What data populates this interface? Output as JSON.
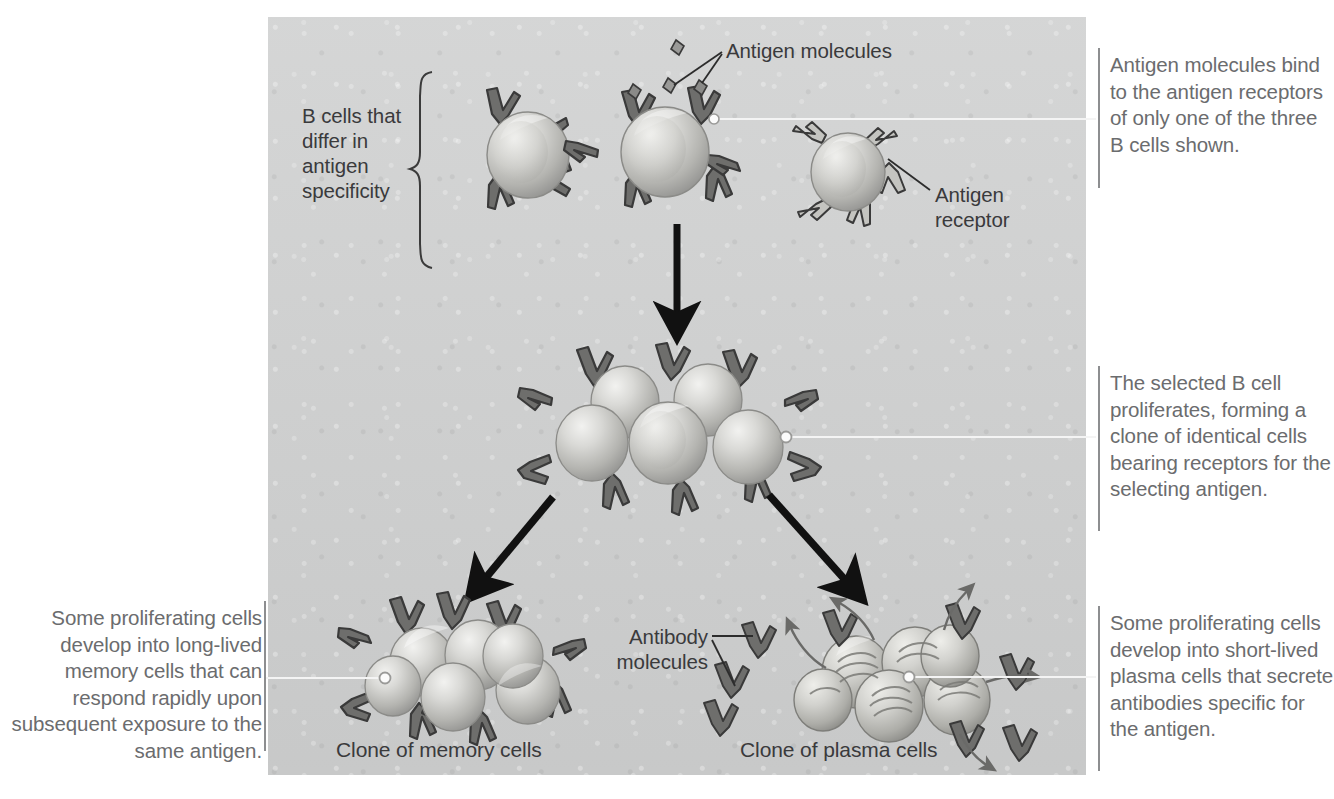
{
  "figure": {
    "panel_color": "#cfd0d0",
    "text_color": "#6b6c6e",
    "label_color": "#3a3a3c"
  },
  "captions": {
    "top_right": "Antigen molecules bind to the antigen receptors of only one of the three B cells shown.",
    "middle_right": "The selected B cell proliferates, forming a clone of identical cells bearing receptors for the selecting antigen.",
    "bottom_right": "Some proliferating cells develop into short-lived plasma cells that secrete antibodies specific for the antigen.",
    "bottom_left": "Some proliferating cells develop into long-lived memory cells that can respond rapidly upon subsequent exposure to the same antigen."
  },
  "labels": {
    "b_cells_bracket": "B cells that\ndiffer in\nantigen\nspecificity",
    "antigen_molecules": "Antigen molecules",
    "antigen_receptor": "Antigen\nreceptor",
    "antibody_molecules": "Antibody\nmolecules",
    "clone_memory": "Clone of memory cells",
    "clone_plasma": "Clone of plasma cells"
  },
  "diagram_data": {
    "type": "flow-diagram",
    "stages": [
      {
        "name": "naive-b-cells",
        "description": "Three B cells that differ in antigen specificity",
        "cell_count": 3,
        "antigen_bound": 1
      },
      {
        "name": "clone",
        "description": "Selected B cell proliferates into a clone of identical cells",
        "cell_count": 6
      },
      {
        "name": "memory-cells",
        "description": "Clone of long-lived memory cells",
        "cell_count": 6
      },
      {
        "name": "plasma-cells",
        "description": "Clone of short-lived plasma cells secreting antibodies",
        "cell_count": 6,
        "secreted_antibodies": 7
      }
    ],
    "free_antigen_molecules": 2,
    "arrows": [
      {
        "from": "naive-b-cells",
        "to": "clone",
        "direction": "down"
      },
      {
        "from": "clone",
        "to": "memory-cells",
        "direction": "down-left"
      },
      {
        "from": "clone",
        "to": "plasma-cells",
        "direction": "down-right"
      }
    ]
  }
}
